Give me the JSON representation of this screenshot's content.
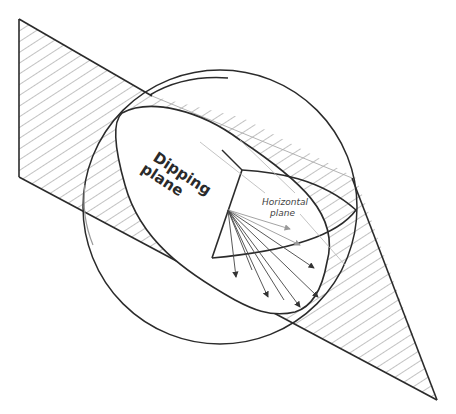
{
  "figure": {
    "labels": {
      "dipping_plane_line1": "Dipping",
      "dipping_plane_line2": "plane",
      "horizontal_plane_line1": "Horizontal",
      "horizontal_plane_line2": "plane"
    },
    "elements": [
      "hatched dipping plane (parallelogram/triangle cross-section)",
      "sphere (circle outline)",
      "dipping plane great-circle ellipse",
      "horizontal plane ellipse",
      "radial arrows from center to dipping plane intersection"
    ],
    "colors": {
      "stroke_dark": "#2b2b2b",
      "stroke_light": "#9a9a9a",
      "hatch": "#777777",
      "background": "#ffffff"
    }
  }
}
